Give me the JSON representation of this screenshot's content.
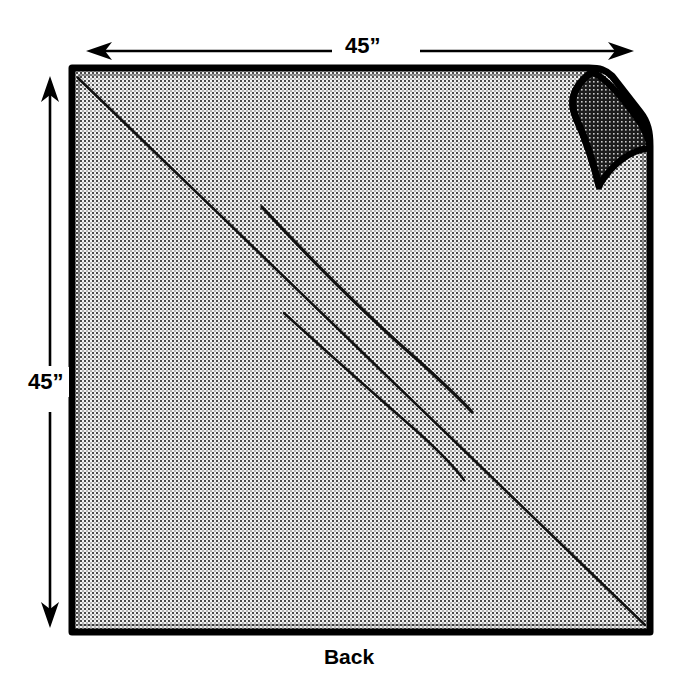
{
  "figure": {
    "kind": "sewing-pattern-diagram",
    "background_color": "#ffffff",
    "ink_color": "#000000",
    "fabric_fill_color": "#d8d8d8",
    "fold_flap_color": "#2b2b2b"
  },
  "dimensions": {
    "width_label": "45”",
    "height_label": "45”",
    "unit": "inches",
    "value": 45
  },
  "annotations": {
    "bottom_caption": "Back"
  },
  "arrows": {
    "top": {
      "name": "width-dimension-arrow",
      "orientation": "horizontal",
      "heads": "both",
      "x1": 88,
      "x2": 632,
      "y": 51
    },
    "left": {
      "name": "height-dimension-arrow",
      "orientation": "vertical",
      "heads": "both",
      "y1": 78,
      "y2": 626,
      "x": 50
    }
  },
  "fabric": {
    "name": "fabric-square",
    "top_left": [
      72,
      68
    ],
    "top_right": [
      618,
      68
    ],
    "bottom_right": [
      650,
      632
    ],
    "bottom_left": [
      72,
      632
    ],
    "corner_fold": {
      "name": "folded-corner-flap",
      "location": "top-right",
      "tip": [
        589,
        75
      ],
      "base_outer": [
        648,
        145
      ],
      "base_inner": [
        600,
        186
      ]
    }
  },
  "fold_lines": [
    {
      "name": "main-diagonal-fold",
      "from": [
        78,
        78
      ],
      "to": [
        645,
        625
      ]
    },
    {
      "name": "drape-crease-upper",
      "from": [
        262,
        207
      ],
      "to": [
        472,
        412
      ]
    },
    {
      "name": "drape-crease-lower",
      "from": [
        284,
        313
      ],
      "to": [
        464,
        480
      ]
    }
  ]
}
